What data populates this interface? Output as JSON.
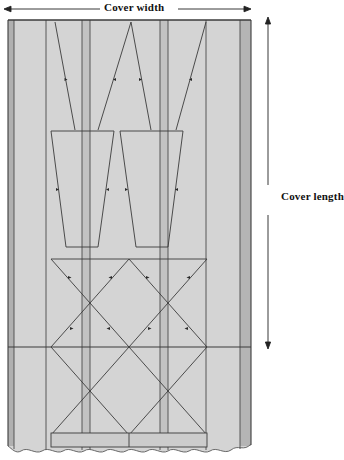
{
  "diagram": {
    "type": "technical-pattern-diagram",
    "dimension_labels": {
      "width": "Cover width",
      "length": "Cover length"
    },
    "colors": {
      "panel_fill": "#d4d4d4",
      "seam_strip_fill": "#b9b9b9",
      "line": "#3b3b3b",
      "arrow": "#222222",
      "background": "#ffffff",
      "text": "#111111"
    },
    "geometry": {
      "cover_rect": {
        "x": 8,
        "y": 20,
        "width": 243,
        "height": 432
      },
      "width_arrow": {
        "x1": 5,
        "x2": 250,
        "y": 9
      },
      "length_arrow": {
        "x": 268,
        "y1": 18,
        "y2": 348,
        "gap_top": 178,
        "gap_bottom": 214
      },
      "vertical_seams_x": [
        14,
        46,
        82,
        90,
        160,
        168,
        206,
        240
      ],
      "horizontal_seam_y": 347,
      "hem_band": {
        "y_top": 432,
        "y_bottom": 447
      },
      "scallop_y": 452
    },
    "panels": [
      {
        "name": "left-border-strip",
        "x": 8,
        "width": 6
      },
      {
        "name": "left-panel",
        "x": 14,
        "width": 68
      },
      {
        "name": "left-seam-strip",
        "x": 82,
        "width": 8
      },
      {
        "name": "center-panel",
        "x": 90,
        "width": 70
      },
      {
        "name": "right-seam-strip",
        "x": 160,
        "width": 8
      },
      {
        "name": "right-panel",
        "x": 168,
        "width": 72
      },
      {
        "name": "right-border-strip",
        "x": 240,
        "width": 11
      }
    ],
    "stitch_groups": [
      {
        "name": "upper-taper-lines",
        "y_start": 22,
        "y_end": 130,
        "count": 4
      },
      {
        "name": "trapezoid-left",
        "y_start": 130,
        "y_end": 247
      },
      {
        "name": "trapezoid-right",
        "y_start": 130,
        "y_end": 247
      },
      {
        "name": "diamond-lattice",
        "y_start": 258,
        "y_end": 432
      }
    ]
  }
}
